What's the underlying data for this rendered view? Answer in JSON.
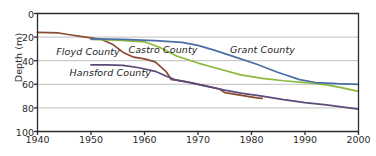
{
  "chart_data": {
    "type": "line",
    "title": "",
    "xlabel": "",
    "ylabel": "Depth (m)",
    "xlim": [
      1940,
      2000
    ],
    "ylim": [
      0,
      100
    ],
    "y_inverted": true,
    "grid": "horizontal",
    "legend_position": "inline-labels",
    "xticks": [
      1940,
      1950,
      1960,
      1970,
      1980,
      1990,
      2000
    ],
    "yticks": [
      0,
      20,
      40,
      60,
      80,
      100
    ],
    "series": [
      {
        "name": "Floyd County",
        "color": "#8c4a30",
        "label_x": 1943.5,
        "label_y": 33,
        "points": [
          [
            1940,
            16
          ],
          [
            1944,
            16.5
          ],
          [
            1946,
            18
          ],
          [
            1949,
            20
          ],
          [
            1952,
            22
          ],
          [
            1954,
            26
          ],
          [
            1956,
            33
          ],
          [
            1958,
            37
          ],
          [
            1960,
            38.5
          ],
          [
            1962,
            41
          ],
          [
            1964,
            49
          ],
          [
            1965,
            56
          ],
          [
            1966,
            56.5
          ],
          [
            1968,
            58
          ],
          [
            1970,
            60
          ],
          [
            1972,
            62
          ],
          [
            1974,
            64
          ],
          [
            1975,
            67
          ],
          [
            1977,
            68.5
          ],
          [
            1979,
            70
          ],
          [
            1981,
            71.5
          ],
          [
            1982,
            72
          ]
        ]
      },
      {
        "name": "Castro County",
        "color": "#8cb83c",
        "label_x": 1957,
        "label_y": 31,
        "points": [
          [
            1950,
            22
          ],
          [
            1955,
            22.5
          ],
          [
            1960,
            24
          ],
          [
            1963,
            29
          ],
          [
            1966,
            36
          ],
          [
            1970,
            42
          ],
          [
            1974,
            47
          ],
          [
            1978,
            52
          ],
          [
            1982,
            55
          ],
          [
            1986,
            57
          ],
          [
            1990,
            58.5
          ],
          [
            1994,
            60.5
          ],
          [
            1997,
            63
          ],
          [
            2000,
            66
          ]
        ]
      },
      {
        "name": "Grant County",
        "color": "#4a6fa5",
        "label_x": 1976,
        "label_y": 31,
        "points": [
          [
            1950,
            21.5
          ],
          [
            1956,
            22
          ],
          [
            1962,
            23
          ],
          [
            1967,
            24.5
          ],
          [
            1970,
            27
          ],
          [
            1973,
            31
          ],
          [
            1977,
            37
          ],
          [
            1981,
            43
          ],
          [
            1985,
            50
          ],
          [
            1989,
            56
          ],
          [
            1992,
            58.5
          ],
          [
            1996,
            59.5
          ],
          [
            2000,
            60
          ]
        ]
      },
      {
        "name": "Hansford County",
        "color": "#5b4a7a",
        "label_x": 1946,
        "label_y": 50,
        "points": [
          [
            1950,
            43.5
          ],
          [
            1953,
            43.5
          ],
          [
            1956,
            44
          ],
          [
            1959,
            46
          ],
          [
            1962,
            49
          ],
          [
            1964,
            53
          ],
          [
            1966,
            56.5
          ],
          [
            1969,
            59
          ],
          [
            1972,
            62
          ],
          [
            1975,
            65
          ],
          [
            1978,
            67.5
          ],
          [
            1982,
            70
          ],
          [
            1986,
            73
          ],
          [
            1990,
            75.5
          ],
          [
            1994,
            77.5
          ],
          [
            2000,
            81
          ]
        ]
      }
    ]
  },
  "axes": {
    "y_title": "Depth (m)",
    "y_ticks": [
      "0",
      "20",
      "40",
      "60",
      "80",
      "100"
    ],
    "x_ticks": [
      "1940",
      "1950",
      "1960",
      "1970",
      "1980",
      "1990",
      "2000"
    ]
  },
  "colors": {
    "axis": "#2b2b2b",
    "grid": "#b8b8b8",
    "background": "#ffffff"
  }
}
